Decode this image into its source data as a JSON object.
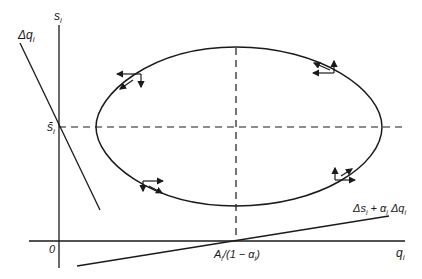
{
  "diagram": {
    "type": "phase diagram",
    "colors": {
      "ink": "#1a1a1a",
      "background": "#ffffff"
    },
    "axes": {
      "y_label": "s_i",
      "y_label_main": "s",
      "y_label_sub": "i",
      "x_label": "q_i",
      "x_label_main": "q",
      "x_label_sub": "i",
      "origin_label": "0"
    },
    "reference_lines": {
      "s_bar_label": "s̄",
      "s_bar_sub": "i",
      "x_intercept_label_main": "A",
      "x_intercept_label_sub1": "i",
      "x_intercept_label_mid": "/(1 − α",
      "x_intercept_label_sub2": "i",
      "x_intercept_label_end": ")",
      "x_intercept_label": "A_i/(1 − α_i)"
    },
    "lines": [
      {
        "name": "delta-q-line",
        "label": "Δq_i",
        "label_main": "Δq",
        "label_sub": "i"
      },
      {
        "name": "delta-s-line",
        "label": "Δs_i + α_i Δq_i",
        "label_part1": "Δs",
        "label_sub1": "i",
        "label_part2": " + α",
        "label_sub2": "i",
        "label_part3": " Δq",
        "label_sub3": "i"
      }
    ],
    "closed_orbit": {
      "description": "closed elliptical trajectory centered at (A_i/(1−α_i), s̄_i)",
      "direction_arrows": [
        "upper-left",
        "upper-right",
        "lower-left",
        "lower-right"
      ]
    }
  }
}
